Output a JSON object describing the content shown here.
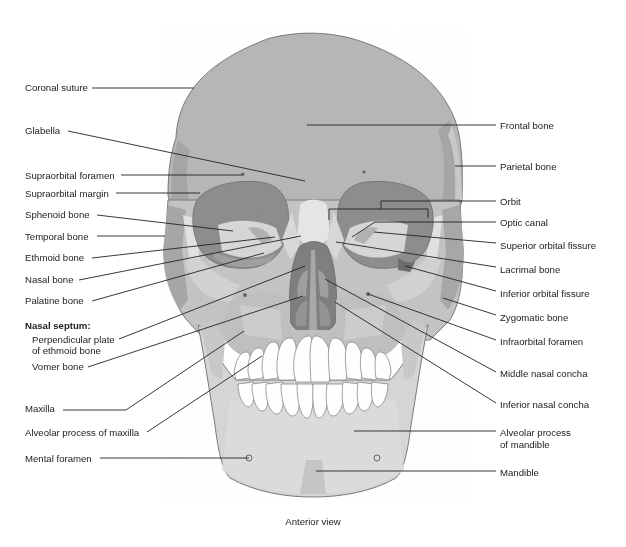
{
  "figure": {
    "view_caption": "Anterior view",
    "figure_title_clipped": "Figure — Skull"
  },
  "colors": {
    "skull_base": "#b9b9b9",
    "skull_dark": "#9a9a9a",
    "skull_light": "#d4d4d4",
    "skull_lighter": "#e4e4e4",
    "orbit": "#8a8a8a",
    "nasal_cavity": "#7e7e7e",
    "teeth": "#ffffff",
    "outline": "#777777",
    "leader": "#222222",
    "text": "#222222"
  },
  "labels_left": [
    {
      "id": "coronal-suture",
      "text": "Coronal suture",
      "x": 25,
      "y": 82,
      "line": [
        92,
        88,
        194,
        88
      ]
    },
    {
      "id": "glabella",
      "text": "Glabella",
      "x": 25,
      "y": 125,
      "line": [
        68,
        131,
        305,
        181
      ]
    },
    {
      "id": "supraorbital-foramen",
      "text": "Supraorbital foramen",
      "x": 25,
      "y": 170,
      "line": [
        121,
        175,
        243,
        175
      ]
    },
    {
      "id": "supraorbital-margin",
      "text": "Supraorbital margin",
      "x": 25,
      "y": 188,
      "line": [
        116,
        193,
        200,
        193
      ]
    },
    {
      "id": "sphenoid-bone",
      "text": "Sphenoid bone",
      "x": 25,
      "y": 209,
      "line": [
        97,
        215,
        233,
        231
      ]
    },
    {
      "id": "temporal-bone",
      "text": "Temporal bone",
      "x": 25,
      "y": 231,
      "line": [
        97,
        236,
        165,
        236
      ]
    },
    {
      "id": "ethmoid-bone",
      "text": "Ethmoid bone",
      "x": 25,
      "y": 252,
      "line": [
        92,
        258,
        275,
        237
      ]
    },
    {
      "id": "nasal-bone",
      "text": "Nasal bone",
      "x": 25,
      "y": 274,
      "line": [
        79,
        280,
        301,
        236
      ]
    },
    {
      "id": "palatine-bone",
      "text": "Palatine bone",
      "x": 25,
      "y": 295,
      "line": [
        92,
        301,
        264,
        253
      ]
    },
    {
      "id": "perpendicular-plate",
      "text": "Perpendicular plate",
      "x": 32,
      "y": 334,
      "line": [
        119,
        339,
        305,
        266
      ]
    },
    {
      "id": "perpendicular-plate-2",
      "text": "of ethmoid bone",
      "x": 32,
      "y": 345,
      "line": null
    },
    {
      "id": "vomer-bone",
      "text": "Vomer bone",
      "x": 32,
      "y": 361,
      "line": [
        88,
        367,
        303,
        296
      ]
    },
    {
      "id": "maxilla",
      "text": "Maxilla",
      "x": 25,
      "y": 403,
      "line": [
        63,
        410,
        126,
        410,
        244,
        331
      ]
    },
    {
      "id": "alveolar-process-maxilla",
      "text": "Alveolar process of maxilla",
      "x": 25,
      "y": 427,
      "line": [
        147,
        432,
        262,
        356
      ]
    },
    {
      "id": "mental-foramen",
      "text": "Mental foramen",
      "x": 25,
      "y": 453,
      "line": [
        100,
        458,
        249,
        458
      ]
    }
  ],
  "septum_heading": {
    "text": "Nasal septum:",
    "x": 25,
    "y": 320
  },
  "labels_right": [
    {
      "id": "frontal-bone",
      "text": "Frontal bone",
      "x": 500,
      "y": 120,
      "line": [
        307,
        125,
        496,
        125
      ]
    },
    {
      "id": "parietal-bone",
      "text": "Parietal bone",
      "x": 500,
      "y": 161,
      "line": [
        455,
        166,
        496,
        166
      ]
    },
    {
      "id": "orbit",
      "text": "Orbit",
      "x": 500,
      "y": 196,
      "line": [
        496,
        201,
        381,
        201,
        381,
        209
      ]
    },
    {
      "id": "optic-canal",
      "text": "Optic canal",
      "x": 500,
      "y": 217,
      "line": [
        496,
        222,
        375,
        222,
        352,
        237
      ]
    },
    {
      "id": "superior-orbital-fissure",
      "text": "Superior orbital fissure",
      "x": 500,
      "y": 240,
      "line": [
        496,
        243,
        374,
        232
      ]
    },
    {
      "id": "lacrimal-bone",
      "text": "Lacrimal bone",
      "x": 500,
      "y": 264,
      "line": [
        496,
        267,
        336,
        242
      ]
    },
    {
      "id": "inferior-orbital-fissure",
      "text": "Inferior orbital fissure",
      "x": 500,
      "y": 288,
      "line": [
        496,
        291,
        405,
        266
      ]
    },
    {
      "id": "zygomatic-bone",
      "text": "Zygomatic bone",
      "x": 500,
      "y": 312,
      "line": [
        496,
        315,
        443,
        298
      ]
    },
    {
      "id": "infraorbital-foramen",
      "text": "Infraorbital foramen",
      "x": 500,
      "y": 336,
      "line": [
        496,
        340,
        368,
        294
      ]
    },
    {
      "id": "middle-nasal-concha",
      "text": "Middle nasal concha",
      "x": 500,
      "y": 368,
      "line": [
        496,
        372,
        325,
        279
      ]
    },
    {
      "id": "inferior-nasal-concha",
      "text": "Inferior nasal concha",
      "x": 500,
      "y": 399,
      "line": [
        496,
        403,
        335,
        302
      ]
    },
    {
      "id": "alveolar-process-mandible",
      "text": "Alveolar process",
      "x": 500,
      "y": 427,
      "line": [
        496,
        431,
        354,
        431
      ]
    },
    {
      "id": "alveolar-process-mandible-2",
      "text": "of mandible",
      "x": 500,
      "y": 439,
      "line": null
    },
    {
      "id": "mandible",
      "text": "Mandible",
      "x": 500,
      "y": 467,
      "line": [
        496,
        471,
        316,
        471
      ]
    }
  ],
  "orbit_bracket": [
    329,
    220,
    329,
    209,
    428,
    209,
    428,
    218
  ]
}
